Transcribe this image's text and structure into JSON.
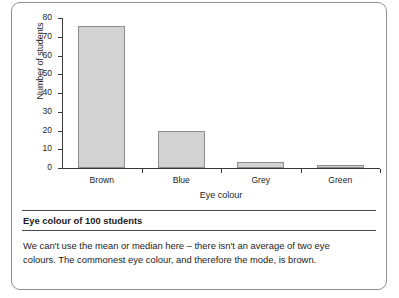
{
  "chart_data": {
    "type": "bar",
    "title": "Eye colour of 100 students",
    "xlabel": "Eye colour",
    "ylabel": "Number of students",
    "categories": [
      "Brown",
      "Blue",
      "Grey",
      "Green"
    ],
    "values": [
      76,
      20,
      3,
      1.5
    ],
    "ylim": [
      0,
      80
    ],
    "yticks": [
      0,
      10,
      20,
      30,
      40,
      50,
      60,
      70,
      80
    ],
    "ytick_labels": [
      "0",
      "10",
      "20",
      "30",
      "40",
      "50",
      "60",
      "70",
      "80"
    ],
    "grid": false,
    "legend": null,
    "bar_fill_color": "#d2d2d2",
    "bar_edge_color": "#8d8d8d",
    "axis_color": "#3a3a3a"
  },
  "caption": {
    "title": "Eye colour of 100 students",
    "explanation_lines": [
      "We can't use the mean or median here – there isn't an average of two eye",
      "colours. The commonest eye colour, and therefore the mode, is brown."
    ],
    "explanation_full": "We can't use the mean or median here – there isn't an average of two eye colours. The commonest eye colour, and therefore the mode, is brown."
  },
  "frame": {
    "border_color": "#8e9296"
  }
}
